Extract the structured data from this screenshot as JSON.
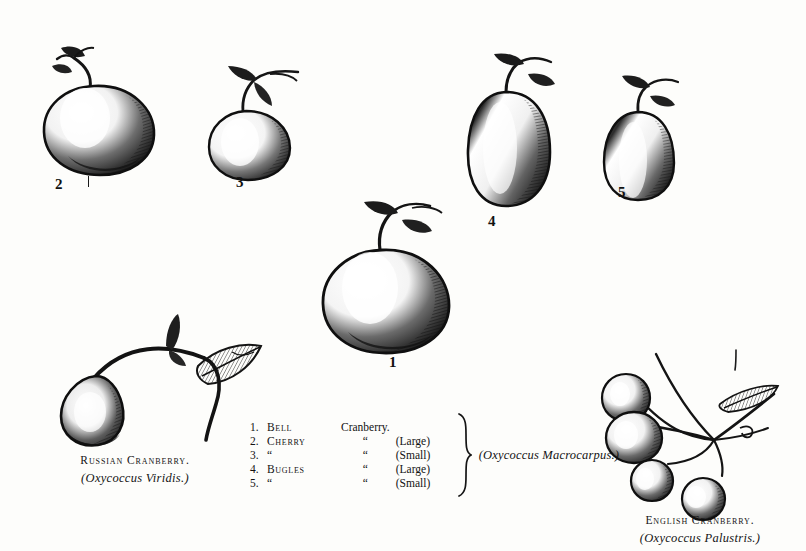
{
  "plate": {
    "title": "Cranberry varieties engraving plate",
    "background_color": "#fdfdfb",
    "ink_color": "#111111"
  },
  "specimens": [
    {
      "id": "berry-2",
      "number": "2",
      "name": "Cherry Cranberry (Large)",
      "shape": "round"
    },
    {
      "id": "berry-3",
      "number": "3",
      "name": "Cherry Cranberry (Small)",
      "shape": "round"
    },
    {
      "id": "berry-4",
      "number": "4",
      "name": "Bugles Cranberry (Large)",
      "shape": "elongated"
    },
    {
      "id": "berry-5",
      "number": "5",
      "name": "Bugles Cranberry (Small)",
      "shape": "elongated"
    },
    {
      "id": "berry-1",
      "number": "1",
      "name": "Bell Cranberry",
      "shape": "bell"
    }
  ],
  "legend": {
    "rows": [
      {
        "num": "1.",
        "name": "Bell",
        "ditto": "Cranberry.",
        "size": ""
      },
      {
        "num": "2.",
        "name": "Cherry",
        "ditto": "“",
        "size": "(Large)"
      },
      {
        "num": "3.",
        "name": "“",
        "ditto": "“",
        "size": "(Small)"
      },
      {
        "num": "4.",
        "name": "Bugles",
        "ditto": "“",
        "size": "(Large)"
      },
      {
        "num": "5.",
        "name": "“",
        "ditto": "“",
        "size": "(Small)"
      }
    ],
    "latin": "(Oxycoccus Macrocarpus.)"
  },
  "captions": {
    "russian": {
      "common": "Russian Cranberry.",
      "latin": "(Oxycoccus Viridis.)"
    },
    "english": {
      "common": "English Cranberry.",
      "latin": "(Oxycoccus Palustris.)"
    }
  }
}
